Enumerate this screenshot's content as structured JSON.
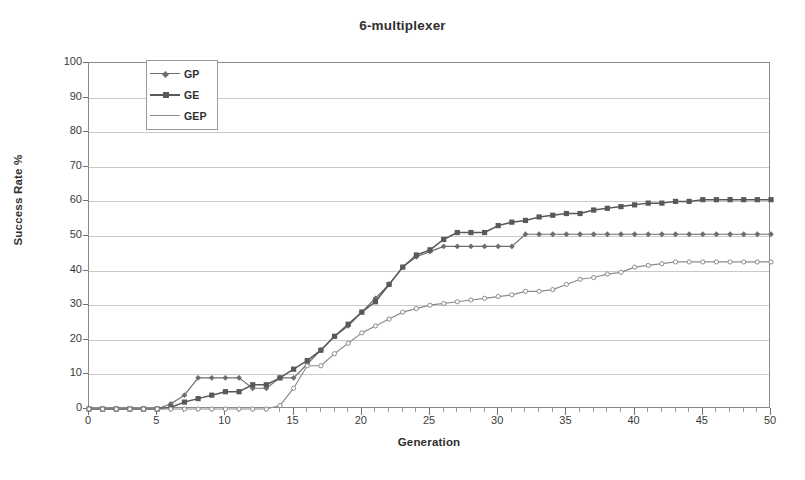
{
  "chart_data": {
    "type": "line",
    "title": "6-multiplexer",
    "xlabel": "Generation",
    "ylabel": "Success Rate %",
    "xlim": [
      0,
      50
    ],
    "ylim": [
      0,
      100
    ],
    "xticks": [
      0,
      5,
      10,
      15,
      20,
      25,
      30,
      35,
      40,
      45,
      50
    ],
    "yticks": [
      0,
      10,
      20,
      30,
      40,
      50,
      60,
      70,
      80,
      90,
      100
    ],
    "x_minor_tick_step": 1,
    "grid": "horizontal",
    "legend_position": "upper-left-inside",
    "x": [
      0,
      1,
      2,
      3,
      4,
      5,
      6,
      7,
      8,
      9,
      10,
      11,
      12,
      13,
      14,
      15,
      16,
      17,
      18,
      19,
      20,
      21,
      22,
      23,
      24,
      25,
      26,
      27,
      28,
      29,
      30,
      31,
      32,
      33,
      34,
      35,
      36,
      37,
      38,
      39,
      40,
      41,
      42,
      43,
      44,
      45,
      46,
      47,
      48,
      49,
      50
    ],
    "series": [
      {
        "name": "GP",
        "marker": "diamond",
        "color": "#6e6e6e",
        "values": [
          0,
          0,
          0,
          0,
          0,
          0,
          1.5,
          4,
          9,
          9,
          9,
          9,
          6,
          6,
          9,
          9,
          13,
          17,
          21,
          24,
          28,
          32,
          36,
          41,
          44,
          45.5,
          47,
          47,
          47,
          47,
          47,
          47,
          50.5,
          50.5,
          50.5,
          50.5,
          50.5,
          50.5,
          50.5,
          50.5,
          50.5,
          50.5,
          50.5,
          50.5,
          50.5,
          50.5,
          50.5,
          50.5,
          50.5,
          50.5,
          50.5
        ]
      },
      {
        "name": "GE",
        "marker": "square",
        "color": "#595959",
        "values": [
          0,
          0,
          0,
          0,
          0,
          0,
          0.5,
          2,
          3,
          4,
          5,
          5,
          7,
          7,
          9,
          11.5,
          14,
          17,
          21,
          24.5,
          28,
          31,
          36,
          41,
          44.5,
          46,
          49,
          51,
          51,
          51,
          53,
          54,
          54.5,
          55.5,
          56,
          56.5,
          56.5,
          57.5,
          58,
          58.5,
          59,
          59.5,
          59.5,
          60,
          60,
          60.5,
          60.5,
          60.5,
          60.5,
          60.5,
          60.5
        ]
      },
      {
        "name": "GEP",
        "marker": "circle",
        "color": "#8c8c8c",
        "values": [
          0,
          0,
          0,
          0,
          0,
          0,
          0,
          0,
          0,
          0,
          0,
          0,
          0,
          0,
          1,
          6,
          12.5,
          12.5,
          16,
          19,
          22,
          24,
          26,
          28,
          29,
          30,
          30.5,
          31,
          31.5,
          32,
          32.5,
          33,
          34,
          34,
          34.5,
          36,
          37.5,
          38,
          39,
          39.5,
          41,
          41.5,
          42,
          42.5,
          42.5,
          42.5,
          42.5,
          42.5,
          42.5,
          42.5,
          42.5
        ]
      }
    ]
  },
  "legend": {
    "items": [
      {
        "label": "GP"
      },
      {
        "label": "GE"
      },
      {
        "label": "GEP"
      }
    ]
  }
}
